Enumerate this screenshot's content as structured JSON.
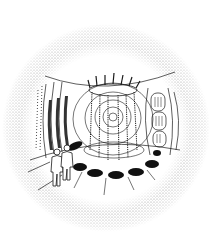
{
  "image": {
    "description": "Fisheye-view pen illustration of a circular room with a central spiral and hanging chains, wall panels, two standing figures, and a ring of dark floor pads, framed by a stippled circular vignette",
    "colors": {
      "background": "#ffffff",
      "ink": "#1a1a1a",
      "stipple": "#8a8a8a",
      "pad": "#111111"
    },
    "elements": {
      "vignette": "stippled circular frame",
      "spiral": "central concentric spiral",
      "chains": "vertical hanging chains from ceiling ring",
      "ceiling_ring": "oval ring with finials at top",
      "left_panels": "tall dark striped wall panels",
      "right_panels": "rounded ribbed wall panels",
      "figures": "two standing figures",
      "floor_pads": "ring of seven dark oval pads"
    }
  }
}
